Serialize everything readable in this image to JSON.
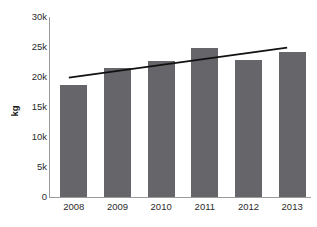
{
  "chart_data": {
    "type": "bar",
    "title": "",
    "xlabel": "",
    "ylabel": "kg",
    "categories": [
      "2008",
      "2009",
      "2010",
      "2011",
      "2012",
      "2013"
    ],
    "values": [
      18600,
      21500,
      22700,
      24800,
      22800,
      24200
    ],
    "ylim": [
      0,
      30000
    ],
    "ytick_values": [
      0,
      5000,
      10000,
      15000,
      20000,
      25000,
      30000
    ],
    "ytick_labels": [
      "0",
      "5k",
      "10k",
      "15k",
      "20k",
      "25k",
      "30k"
    ],
    "grid": false,
    "legend": "none",
    "series": [
      {
        "name": "kg",
        "type": "bar",
        "values": [
          18600,
          21500,
          22700,
          24800,
          22800,
          24200
        ],
        "color": "#66666a"
      },
      {
        "name": "trend",
        "type": "line",
        "x": [
          "2008",
          "2013"
        ],
        "values": [
          19900,
          24900
        ],
        "color": "#111111"
      }
    ],
    "bar_color": "#66666a",
    "trendline_color": "#111111",
    "axis_color": "#9a9a9a",
    "background_color": "#ffffff"
  },
  "axis": {
    "y_label": "kg",
    "y_ticks": [
      "30k",
      "25k",
      "20k",
      "15k",
      "10k",
      "5k",
      "0"
    ],
    "x_ticks": [
      "2008",
      "2009",
      "2010",
      "2011",
      "2012",
      "2013"
    ]
  },
  "header": {
    "title_fragment": ""
  }
}
